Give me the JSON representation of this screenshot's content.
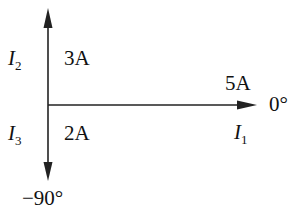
{
  "diagram": {
    "type": "phasor",
    "phasors": [
      {
        "name": "I",
        "subscript": "1",
        "magnitude_label": "5A",
        "angle_label": "0°",
        "direction": "right"
      },
      {
        "name": "I",
        "subscript": "2",
        "magnitude_label": "3A",
        "direction": "up"
      },
      {
        "name": "I",
        "subscript": "3",
        "magnitude_label": "2A",
        "angle_label": "−90°",
        "direction": "down"
      }
    ],
    "colors": {
      "line": "#222222",
      "background": "#ffffff"
    }
  }
}
